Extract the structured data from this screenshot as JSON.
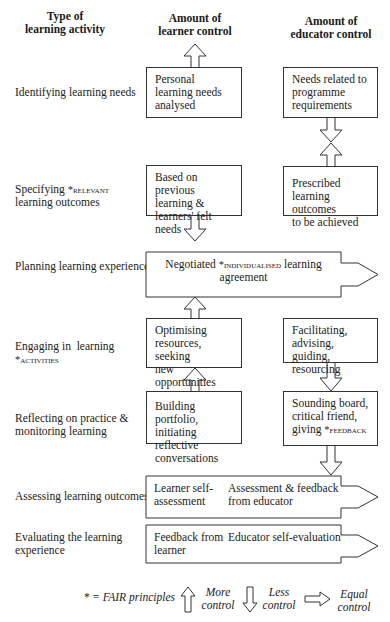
{
  "headers": {
    "activity": [
      "Type of",
      "learning activity"
    ],
    "learner": [
      "Amount of",
      "learner control"
    ],
    "educator": [
      "Amount of",
      "educator control"
    ]
  },
  "activities": [
    {
      "lines": [
        "Identifying learning needs"
      ]
    },
    {
      "line1_pre": "Specifying ",
      "line1_sc": "*relevant",
      "line2": "learning outcomes"
    },
    {
      "lines": [
        "Planning learning experiences"
      ]
    },
    {
      "line1": "Engaging in  learning",
      "line2_sc": "*activities"
    },
    {
      "lines": [
        "Reflecting on practice &",
        "monitoring learning"
      ]
    },
    {
      "lines": [
        "Assessing learning outcomes"
      ]
    },
    {
      "lines": [
        "Evaluating the learning",
        "experience"
      ]
    }
  ],
  "boxes": {
    "personal_needs": [
      "Personal",
      "learning needs",
      "analysed"
    ],
    "programme_needs": [
      "Needs related to",
      "programme",
      "requirements"
    ],
    "previous_learning": [
      "Based on previous",
      "learning &",
      "learners' felt needs"
    ],
    "prescribed_outcomes": [
      "Prescribed",
      "learning outcomes",
      "to be achieved"
    ],
    "negotiated": {
      "pre": "Negotiated ",
      "sc": "*individualised",
      "post": " learning",
      "line2": "agreement"
    },
    "optimising": [
      "Optimising",
      "resources, seeking",
      "new opportunities"
    ],
    "facilitating": [
      "Facilitating,",
      "advising, guiding,",
      "resourcing"
    ],
    "portfolio": [
      "Building portfolio,",
      "initiating reflective",
      "conversations"
    ],
    "sounding": {
      "l1": "Sounding board,",
      "l2": "critical friend,",
      "l3_pre": "giving ",
      "l3_sc": "*feedback"
    },
    "assessing": {
      "left": [
        "Learner self-",
        "assessment"
      ],
      "right": [
        "Assessment & feedback",
        "from educator"
      ]
    },
    "evaluating": {
      "left": [
        "Feedback from",
        "learner"
      ],
      "right": [
        "Educator self-evaluation"
      ]
    }
  },
  "legend": {
    "fair": "* = FAIR principles",
    "more": [
      "More",
      "control"
    ],
    "less": [
      "Less",
      "control"
    ],
    "equal": [
      "Equal",
      "control"
    ]
  }
}
